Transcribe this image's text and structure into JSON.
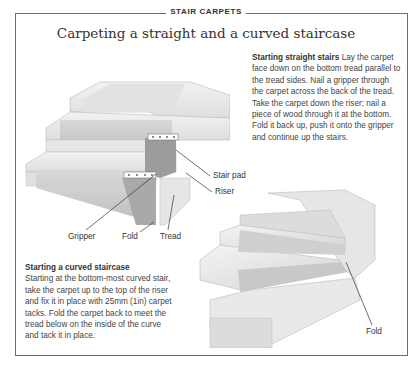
{
  "section_tag": "STAIR CARPETS",
  "title": "Carpeting a straight and a curved staircase",
  "straight": {
    "heading": "Starting straight stairs",
    "body": "Lay the carpet face down on the bottom tread parallel to the tread sides. Nail a gripper through the carpet across the back of the tread. Take the carpet down the riser; nail a piece of wood through it at the bottom. Fold it back up, push it onto the gripper and continue up the stairs."
  },
  "curved": {
    "heading": "Starting a curved staircase",
    "body": "Starting at the bottom-most curved stair, take the carpet up to the top of the riser and fix it in place with 25mm (1in) carpet tacks. Fold the carpet back to meet the tread below on the inside of the curve and tack it in place."
  },
  "labels": {
    "stair_pad": "Stair pad",
    "riser": "Riser",
    "gripper": "Gripper",
    "fold_left": "Fold",
    "tread": "Tread",
    "fold_right": "Fold"
  }
}
